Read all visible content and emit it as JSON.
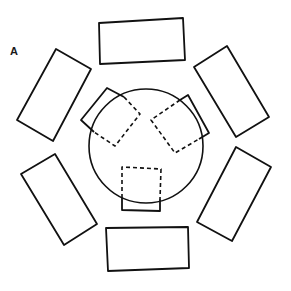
{
  "figure": {
    "panel_label": "A",
    "colors": {
      "stroke": "#111111",
      "background": "#ffffff"
    },
    "table": {
      "shape": "circle",
      "cx": 146,
      "cy": 146,
      "r": 57
    },
    "outer_rectangles": [
      {
        "id": "top",
        "points": "99,23 183,18 185,60 100,64"
      },
      {
        "id": "upper-right",
        "points": "227,46 269,117 236,137 194,67"
      },
      {
        "id": "lower-right",
        "points": "236,147 271,167 232,241 197,222"
      },
      {
        "id": "bottom",
        "points": "106,228 188,227 189,268 108,271"
      },
      {
        "id": "lower-left",
        "points": "55,154 97,224 64,245 21,174"
      },
      {
        "id": "upper-left",
        "points": "56,49 91,69 53,141 17,120"
      }
    ],
    "inner_squares": [
      {
        "id": "upper-left-square",
        "solid_points": "99,101 107,88 118,97",
        "full_points": "107,88 140,114 115,146 81,120",
        "solid_outside": "91,110 81,120 94,132"
      },
      {
        "id": "upper-right-square",
        "full_points": "188,95 209,133 175,153 151,120"
      },
      {
        "id": "bottom-square",
        "full_points": "122,167 161,169 160,211 122,210"
      }
    ]
  }
}
